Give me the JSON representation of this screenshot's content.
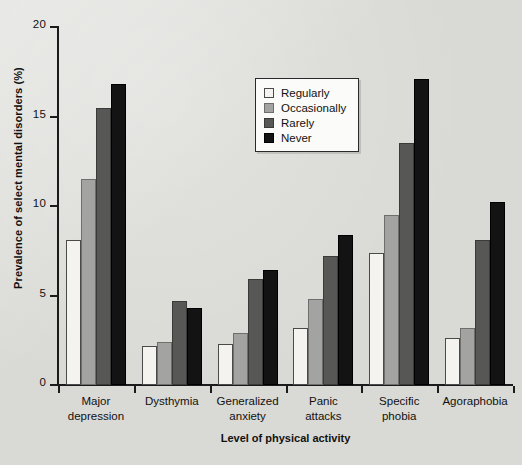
{
  "chart_data": {
    "type": "bar",
    "title": "",
    "xlabel": "Level of physical activity",
    "ylabel": "Prevalence of select mental disorders (%)",
    "ylim": [
      0,
      20
    ],
    "yticks": [
      0,
      5,
      10,
      15,
      20
    ],
    "ytick_labels": [
      "0",
      "5",
      "10",
      "15",
      "20"
    ],
    "grid": false,
    "legend_position": "upper center",
    "categories": [
      "Major depression",
      "Dysthymia",
      "Generalized anxiety",
      "Panic attacks",
      "Specific phobia",
      "Agoraphobia"
    ],
    "category_lines": [
      [
        "Major",
        "depression"
      ],
      [
        "Dysthymia",
        ""
      ],
      [
        "Generalized",
        "anxiety"
      ],
      [
        "Panic",
        "attacks"
      ],
      [
        "Specific",
        "phobia"
      ],
      [
        "Agoraphobia",
        ""
      ]
    ],
    "series": [
      {
        "name": "Regularly",
        "color": "#f4f3f0",
        "values": [
          8.1,
          2.2,
          2.3,
          3.2,
          7.4,
          2.6
        ]
      },
      {
        "name": "Occasionally",
        "color": "#a3a3a1",
        "values": [
          11.5,
          2.4,
          2.9,
          4.8,
          9.5,
          3.2
        ]
      },
      {
        "name": "Rarely",
        "color": "#575756",
        "values": [
          15.5,
          4.7,
          5.9,
          7.2,
          13.5,
          8.1
        ]
      },
      {
        "name": "Never",
        "color": "#131313",
        "values": [
          16.8,
          4.3,
          6.4,
          8.4,
          17.1,
          10.2
        ]
      }
    ]
  },
  "legend": {
    "items": [
      "Regularly",
      "Occasionally",
      "Rarely",
      "Never"
    ]
  }
}
